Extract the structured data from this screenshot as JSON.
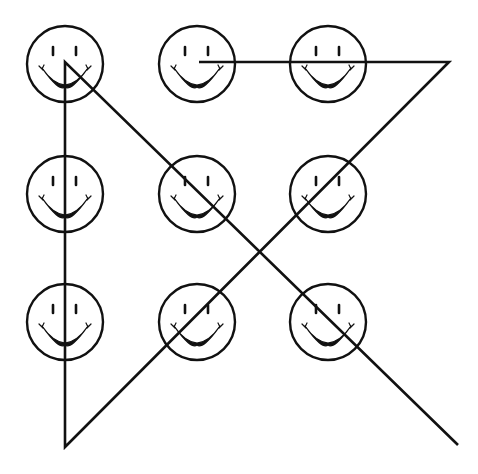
{
  "puzzle": {
    "title": "",
    "description": "Nine smiley faces in a 3x3 grid connected by four continuous straight lines",
    "grid": {
      "rows": 3,
      "cols": 3,
      "col_x": [
        65,
        197,
        328
      ],
      "row_y": [
        64,
        194,
        322
      ],
      "face_radius": 38
    },
    "faces": [
      {
        "id": "r1c1",
        "row": 1,
        "col": 1,
        "cx": 65,
        "cy": 64
      },
      {
        "id": "r1c2",
        "row": 1,
        "col": 2,
        "cx": 197,
        "cy": 64
      },
      {
        "id": "r1c3",
        "row": 1,
        "col": 3,
        "cx": 328,
        "cy": 64
      },
      {
        "id": "r2c1",
        "row": 2,
        "col": 1,
        "cx": 65,
        "cy": 194
      },
      {
        "id": "r2c2",
        "row": 2,
        "col": 2,
        "cx": 197,
        "cy": 194
      },
      {
        "id": "r2c3",
        "row": 2,
        "col": 3,
        "cx": 328,
        "cy": 194
      },
      {
        "id": "r3c1",
        "row": 3,
        "col": 1,
        "cx": 65,
        "cy": 322
      },
      {
        "id": "r3c2",
        "row": 3,
        "col": 2,
        "cx": 197,
        "cy": 322
      },
      {
        "id": "r3c3",
        "row": 3,
        "col": 3,
        "cx": 328,
        "cy": 322
      }
    ],
    "line_path": {
      "segment_count": 4,
      "points": [
        [
          199,
          62
        ],
        [
          449,
          62
        ],
        [
          65,
          447
        ],
        [
          65,
          62
        ],
        [
          458,
          445
        ]
      ]
    },
    "colors": {
      "background": "#ffffff",
      "ink": "#111111"
    }
  }
}
